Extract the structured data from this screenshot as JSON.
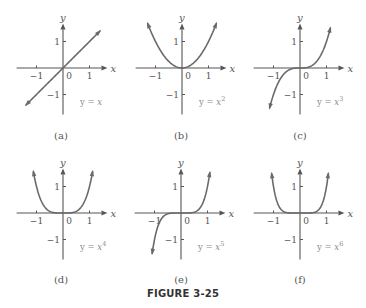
{
  "figure": {
    "title": "FIGURE 3-25"
  },
  "panels": [
    {
      "caption": "(a)",
      "equation": "y = x",
      "exponent": "",
      "power": 1,
      "origin": [
        63,
        68
      ]
    },
    {
      "caption": "(b)",
      "equation": "y = x",
      "exponent": "2",
      "power": 2,
      "origin": [
        182,
        68
      ]
    },
    {
      "caption": "(c)",
      "equation": "y = x",
      "exponent": "3",
      "power": 3,
      "origin": [
        300,
        68
      ]
    },
    {
      "caption": "(d)",
      "equation": "y = x",
      "exponent": "4",
      "power": 4,
      "origin": [
        63,
        213
      ]
    },
    {
      "caption": "(e)",
      "equation": "y = x",
      "exponent": "5",
      "power": 5,
      "origin": [
        181,
        213
      ]
    },
    {
      "caption": "(f)",
      "equation": "y = x",
      "exponent": "6",
      "power": 6,
      "origin": [
        300,
        213
      ]
    }
  ],
  "axes": {
    "x_label": "x",
    "y_label": "y",
    "x_ticks": [
      "-1",
      "0",
      "1"
    ],
    "y_ticks": [
      "1",
      "-1"
    ],
    "unit_px": 26.5
  },
  "chart_data": [
    {
      "type": "line",
      "title": "(a) y = x",
      "xlabel": "x",
      "ylabel": "y",
      "function": "x^1",
      "xlim": [
        -1.4,
        1.4
      ],
      "ylim": [
        -1.6,
        1.6
      ],
      "x_ticks": [
        -1,
        0,
        1
      ],
      "y_ticks": [
        -1,
        1
      ],
      "x": [
        -1.4,
        -1,
        -0.5,
        0,
        0.5,
        1,
        1.4
      ],
      "y": [
        -1.4,
        -1,
        -0.5,
        0,
        0.5,
        1,
        1.4
      ],
      "grid": false,
      "legend": null
    },
    {
      "type": "line",
      "title": "(b) y = x^2",
      "xlabel": "x",
      "ylabel": "y",
      "function": "x^2",
      "xlim": [
        -1.4,
        1.4
      ],
      "ylim": [
        -1.6,
        1.6
      ],
      "x_ticks": [
        -1,
        0,
        1
      ],
      "y_ticks": [
        -1,
        1
      ],
      "x": [
        -1.3,
        -1,
        -0.5,
        0,
        0.5,
        1,
        1.3
      ],
      "y": [
        1.69,
        1,
        0.25,
        0,
        0.25,
        1,
        1.69
      ],
      "grid": false,
      "legend": null
    },
    {
      "type": "line",
      "title": "(c) y = x^3",
      "xlabel": "x",
      "ylabel": "y",
      "function": "x^3",
      "xlim": [
        -1.4,
        1.4
      ],
      "ylim": [
        -1.6,
        1.6
      ],
      "x_ticks": [
        -1,
        0,
        1
      ],
      "y_ticks": [
        -1,
        1
      ],
      "x": [
        -1.15,
        -1,
        -0.5,
        0,
        0.5,
        1,
        1.15
      ],
      "y": [
        -1.52,
        -1,
        -0.125,
        0,
        0.125,
        1,
        1.52
      ],
      "grid": false,
      "legend": null
    },
    {
      "type": "line",
      "title": "(d) y = x^4",
      "xlabel": "x",
      "ylabel": "y",
      "function": "x^4",
      "xlim": [
        -1.4,
        1.4
      ],
      "ylim": [
        -1.6,
        1.6
      ],
      "x_ticks": [
        -1,
        0,
        1
      ],
      "y_ticks": [
        -1,
        1
      ],
      "x": [
        -1.12,
        -1,
        -0.5,
        0,
        0.5,
        1,
        1.12
      ],
      "y": [
        1.57,
        1,
        0.0625,
        0,
        0.0625,
        1,
        1.57
      ],
      "grid": false,
      "legend": null
    },
    {
      "type": "line",
      "title": "(e) y = x^5",
      "xlabel": "x",
      "ylabel": "y",
      "function": "x^5",
      "xlim": [
        -1.4,
        1.4
      ],
      "ylim": [
        -1.6,
        1.6
      ],
      "x_ticks": [
        -1,
        0,
        1
      ],
      "y_ticks": [
        -1,
        1
      ],
      "x": [
        -1.09,
        -1,
        -0.5,
        0,
        0.5,
        1,
        1.09
      ],
      "y": [
        -1.54,
        -1,
        -0.031,
        0,
        0.031,
        1,
        1.54
      ],
      "grid": false,
      "legend": null
    },
    {
      "type": "line",
      "title": "(f) y = x^6",
      "xlabel": "x",
      "ylabel": "y",
      "function": "x^6",
      "xlim": [
        -1.4,
        1.4
      ],
      "ylim": [
        -1.6,
        1.6
      ],
      "x_ticks": [
        -1,
        0,
        1
      ],
      "y_ticks": [
        -1,
        1
      ],
      "x": [
        -1.07,
        -1,
        -0.5,
        0,
        0.5,
        1,
        1.07
      ],
      "y": [
        1.5,
        1,
        0.016,
        0,
        0.016,
        1,
        1.5
      ],
      "grid": false,
      "legend": null
    }
  ]
}
